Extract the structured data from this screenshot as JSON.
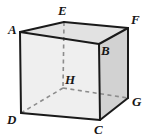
{
  "figure": {
    "name": "labelled-cube-diagram",
    "background_color": "#ffffff"
  },
  "colors": {
    "face_front": "#efefef",
    "face_top": "#e2e2e2",
    "face_right": "#d2d2d2",
    "edge_visible": "#1a1a1a",
    "edge_hidden": "#8c8c8c",
    "label_text": "#161616"
  },
  "geometry": {
    "front_face": "A,B,C,D",
    "back_face": "E,F,G,H",
    "visible_edges": [
      "A-B",
      "B-C",
      "C-D",
      "D-A",
      "A-E",
      "E-F",
      "F-B",
      "F-G",
      "G-C"
    ],
    "hidden_edges": [
      "E-H",
      "H-D",
      "H-G"
    ]
  },
  "vertices": [
    {
      "id": "A",
      "label": "A",
      "x": 20,
      "y": 32,
      "hidden": false,
      "label_x": 8,
      "label_y": 23
    },
    {
      "id": "B",
      "label": "B",
      "x": 99,
      "y": 44,
      "hidden": false,
      "label_x": 101,
      "label_y": 44
    },
    {
      "id": "C",
      "label": "C",
      "x": 100,
      "y": 120,
      "hidden": false,
      "label_x": 94,
      "label_y": 123
    },
    {
      "id": "D",
      "label": "D",
      "x": 21,
      "y": 113,
      "hidden": false,
      "label_x": 7,
      "label_y": 113
    },
    {
      "id": "E",
      "label": "E",
      "x": 64,
      "y": 22,
      "hidden": false,
      "label_x": 58,
      "label_y": 4
    },
    {
      "id": "F",
      "label": "F",
      "x": 128,
      "y": 28,
      "hidden": false,
      "label_x": 131,
      "label_y": 13
    },
    {
      "id": "G",
      "label": "G",
      "x": 128,
      "y": 98,
      "hidden": false,
      "label_x": 132,
      "label_y": 95
    },
    {
      "id": "H",
      "label": "H",
      "x": 63,
      "y": 88,
      "hidden": true,
      "label_x": 65,
      "label_y": 73
    }
  ]
}
